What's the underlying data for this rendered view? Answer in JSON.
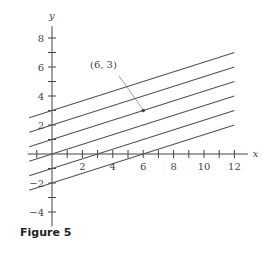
{
  "figure": {
    "caption": "Figure 5"
  },
  "chart_data": {
    "type": "line",
    "title": "",
    "xlabel": "x",
    "ylabel": "y",
    "xlim": [
      -1.5,
      13
    ],
    "ylim": [
      -5,
      9
    ],
    "x_ticks": [
      2,
      4,
      6,
      8,
      10,
      12
    ],
    "y_ticks": [
      -4,
      -2,
      2,
      4,
      6,
      8
    ],
    "grid": false,
    "series": [
      {
        "name": "y = x/3 + 3",
        "slope": 0.3333,
        "intercept": 3,
        "x": [
          -1.5,
          12
        ],
        "y": [
          2.5,
          7
        ]
      },
      {
        "name": "y = x/3 + 2",
        "slope": 0.3333,
        "intercept": 2,
        "x": [
          -1.5,
          12
        ],
        "y": [
          1.5,
          6
        ]
      },
      {
        "name": "y = x/3 + 1",
        "slope": 0.3333,
        "intercept": 1,
        "x": [
          -1.5,
          12
        ],
        "y": [
          0.5,
          5
        ]
      },
      {
        "name": "y = x/3",
        "slope": 0.3333,
        "intercept": 0,
        "x": [
          -1.5,
          12
        ],
        "y": [
          -0.5,
          4
        ]
      },
      {
        "name": "y = x/3 - 1",
        "slope": 0.3333,
        "intercept": -1,
        "x": [
          -1.5,
          12
        ],
        "y": [
          -1.5,
          3
        ]
      },
      {
        "name": "y = x/3 - 2",
        "slope": 0.3333,
        "intercept": -2,
        "x": [
          -1.5,
          12
        ],
        "y": [
          -2.5,
          2
        ]
      }
    ],
    "annotations": [
      {
        "text": "(6, 3)",
        "point": [
          6,
          3
        ]
      }
    ]
  }
}
